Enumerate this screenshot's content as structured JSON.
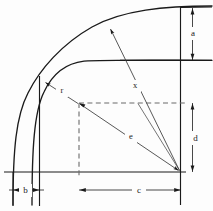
{
  "diagram": {
    "background_color": "#fdfdfd",
    "line_color": "#1a1a1a",
    "dashed_color": "#6b6b6b",
    "thin_color": "#3a3a3a",
    "labels": {
      "a": "a",
      "b": "b",
      "c": "c",
      "d": "d",
      "e": "e",
      "r": "r",
      "x": "x"
    },
    "label_positions": {
      "a": {
        "x": 193,
        "y": 33
      },
      "b": {
        "x": 24,
        "y": 191
      },
      "c": {
        "x": 139,
        "y": 190
      },
      "d": {
        "x": 196,
        "y": 138
      },
      "e": {
        "x": 131,
        "y": 137
      },
      "r": {
        "x": 62,
        "y": 91
      },
      "x": {
        "x": 135,
        "y": 86
      }
    },
    "geometry": {
      "apex_point": {
        "x": 180.5,
        "y": 172
      },
      "inner_corner": {
        "x": 79,
        "y": 103
      },
      "tangent_point": {
        "x": 41.5,
        "y": 80.5
      },
      "baseline_y": 172,
      "inner_horizontal_y": 60.5,
      "outer_curve_bottom_x": 13,
      "inner_vertical_x": 39.5,
      "right_vertical_x": 180.5,
      "dim_line_right_x": 192.5,
      "dim_line_bottom_y": 190,
      "top_curve_right_y": 8
    },
    "dimension_count": 7
  }
}
